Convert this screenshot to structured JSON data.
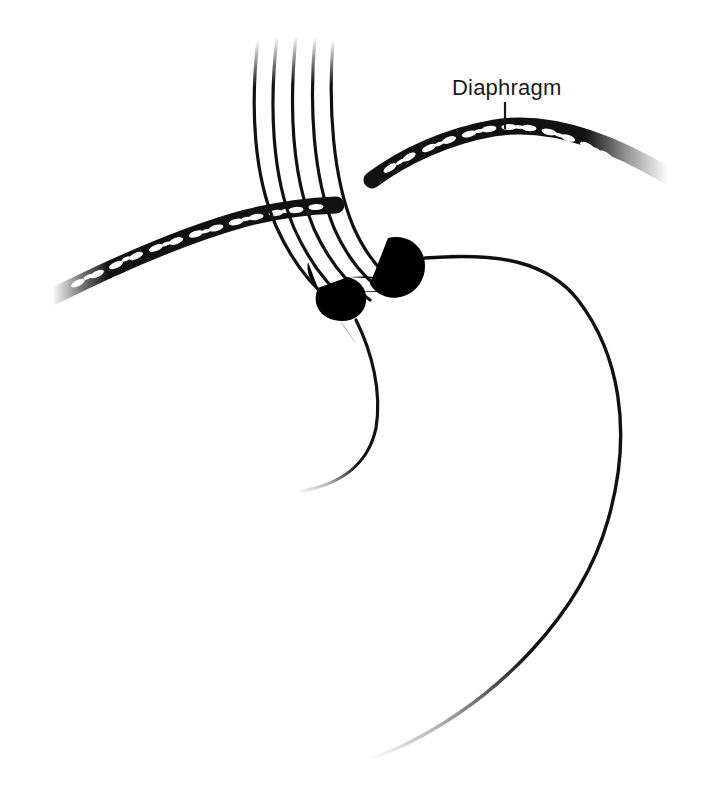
{
  "figure": {
    "type": "medical-line-illustration",
    "background_color": "#ffffff",
    "ink_color": "#111111",
    "width": 710,
    "height": 801
  },
  "labels": [
    {
      "id": "diaphragm",
      "text": "Diaphragm",
      "text_x": 452,
      "text_y": 95,
      "font_size": 22,
      "leader_line": {
        "x1": 505,
        "y1": 102,
        "x2": 505,
        "y2": 129
      }
    }
  ],
  "structures": [
    {
      "name": "diaphragm-left-crus-band",
      "style": "fiber-hatched-band",
      "fades": "left-tip"
    },
    {
      "name": "diaphragm-right-crus-band",
      "style": "fiber-hatched-band",
      "fades": "right-tip"
    },
    {
      "name": "esophagus",
      "style": "five-parallel-longitudinal-lines",
      "line_count": 5,
      "fades": "top"
    },
    {
      "name": "fundoplication-wrap",
      "style": "segmented-ridged-collar"
    },
    {
      "name": "stomach-greater-curvature",
      "style": "single-contour",
      "fades": "bottom-left-tip"
    },
    {
      "name": "stomach-lesser-curvature",
      "style": "single-contour",
      "fades": "bottom-tip"
    },
    {
      "name": "gastric-fundus-contour",
      "style": "single-contour"
    }
  ]
}
